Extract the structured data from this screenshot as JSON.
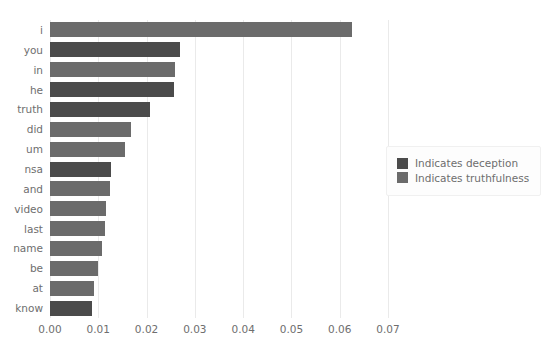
{
  "legend": {
    "position": "right",
    "items": [
      {
        "label": "Indicates deception",
        "color": "#4b4b4b",
        "key": "deception"
      },
      {
        "label": "Indicates truthfulness",
        "color": "#6b6b6b",
        "key": "truthfulness"
      }
    ]
  },
  "axis": {
    "x_ticks": [
      "0.00",
      "0.01",
      "0.02",
      "0.03",
      "0.04",
      "0.05",
      "0.06",
      "0.07"
    ],
    "x_tick_values": [
      0.0,
      0.01,
      0.02,
      0.03,
      0.04,
      0.05,
      0.06,
      0.07
    ]
  },
  "chart_data": {
    "type": "bar",
    "orientation": "horizontal",
    "title": "",
    "subtitle": "",
    "xlabel": "",
    "ylabel": "",
    "xlim": [
      0.0,
      0.07
    ],
    "grid": true,
    "legend_position": "right",
    "categories": [
      "i",
      "you",
      "in",
      "he",
      "truth",
      "did",
      "um",
      "nsa",
      "and",
      "video",
      "last",
      "name",
      "be",
      "at",
      "know"
    ],
    "values": [
      0.0625,
      0.027,
      0.0258,
      0.0256,
      0.0208,
      0.0168,
      0.0155,
      0.0127,
      0.0124,
      0.0115,
      0.0113,
      0.0107,
      0.01,
      0.0092,
      0.0087
    ],
    "groups": [
      "truthfulness",
      "deception",
      "truthfulness",
      "deception",
      "deception",
      "truthfulness",
      "truthfulness",
      "deception",
      "truthfulness",
      "truthfulness",
      "truthfulness",
      "truthfulness",
      "truthfulness",
      "truthfulness",
      "deception"
    ],
    "series": [
      {
        "name": "Indicates deception",
        "color": "#4b4b4b"
      },
      {
        "name": "Indicates truthfulness",
        "color": "#6b6b6b"
      }
    ]
  }
}
